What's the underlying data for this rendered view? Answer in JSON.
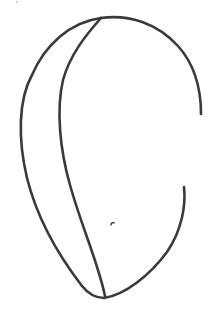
{
  "drawing": {
    "description": "Hand-drawn line sketch of an egg/seed-like shape with an inner dividing curve",
    "stroke_color": "#3a3a3a",
    "background_color": "#ffffff",
    "stroke_width": 2.6
  }
}
